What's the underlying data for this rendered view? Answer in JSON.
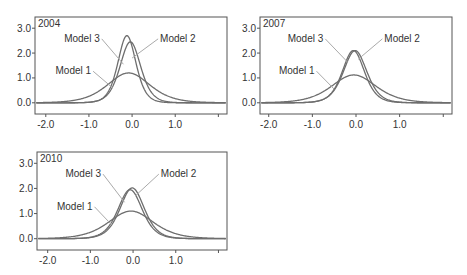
{
  "colors": {
    "curve": "#6e6e6e",
    "frame": "#555555",
    "leader": "#aaaaaa",
    "text": "#333333"
  },
  "chart_data": [
    {
      "type": "line",
      "title": "2004",
      "xlabel": "",
      "ylabel": "",
      "xlim": [
        -2.25,
        2.2
      ],
      "ylim": [
        -0.45,
        3.45
      ],
      "xticks": [
        -2.0,
        -1.0,
        0.0,
        1.0,
        2.0
      ],
      "xtick_labels": [
        "-2.0",
        "-1.0",
        "0.0",
        "1.0",
        ""
      ],
      "yticks": [
        0.0,
        1.0,
        2.0,
        3.0
      ],
      "ytick_labels": [
        "0.0",
        "1.0",
        "2.0",
        "3.0"
      ],
      "grid": false,
      "legend": "direct labels with leader lines",
      "series": [
        {
          "name": "Model 1",
          "peak": 1.2,
          "center": -0.08,
          "width": 0.33,
          "shape": "logistic"
        },
        {
          "name": "Model 2",
          "peak": 2.45,
          "center": -0.04,
          "width": 0.16,
          "shape": "logistic"
        },
        {
          "name": "Model 3",
          "peak": 2.7,
          "center": -0.12,
          "width": 0.14,
          "shape": "logistic"
        }
      ],
      "labels": [
        {
          "text": "Model 3",
          "x": -0.75,
          "y": 2.45,
          "to_x": -0.2,
          "to_y": 1.55
        },
        {
          "text": "Model 2",
          "x": 0.65,
          "y": 2.45,
          "to_x": 0.0,
          "to_y": 1.8
        },
        {
          "text": "Model 1",
          "x": -0.95,
          "y": 1.15,
          "to_x": -0.45,
          "to_y": 0.6
        }
      ]
    },
    {
      "type": "line",
      "title": "2007",
      "xlabel": "",
      "ylabel": "",
      "xlim": [
        -2.2,
        2.2
      ],
      "ylim": [
        -0.45,
        3.45
      ],
      "xticks": [
        -2.0,
        -1.0,
        0.0,
        1.0,
        2.0
      ],
      "xtick_labels": [
        "-2.0",
        "-1.0",
        "0.0",
        "1.0",
        ""
      ],
      "yticks": [
        0.0,
        1.0,
        2.0,
        3.0
      ],
      "ytick_labels": [
        "0.0",
        "1.0",
        "2.0",
        "3.0"
      ],
      "grid": false,
      "legend": "direct labels with leader lines",
      "series": [
        {
          "name": "Model 1",
          "peak": 1.12,
          "center": -0.05,
          "width": 0.34,
          "shape": "logistic"
        },
        {
          "name": "Model 2",
          "peak": 2.1,
          "center": -0.02,
          "width": 0.18,
          "shape": "logistic"
        },
        {
          "name": "Model 3",
          "peak": 2.1,
          "center": -0.06,
          "width": 0.17,
          "shape": "logistic"
        }
      ],
      "labels": [
        {
          "text": "Model 3",
          "x": -0.75,
          "y": 2.45,
          "to_x": -0.2,
          "to_y": 1.65
        },
        {
          "text": "Model 2",
          "x": 0.65,
          "y": 2.45,
          "to_x": 0.05,
          "to_y": 1.75
        },
        {
          "text": "Model 1",
          "x": -0.95,
          "y": 1.15,
          "to_x": -0.5,
          "to_y": 0.55
        }
      ]
    },
    {
      "type": "line",
      "title": "2010",
      "xlabel": "",
      "ylabel": "",
      "xlim": [
        -2.25,
        2.2
      ],
      "ylim": [
        -0.45,
        3.45
      ],
      "xticks": [
        -2.0,
        -1.0,
        0.0,
        1.0,
        2.0
      ],
      "xtick_labels": [
        "-2.0",
        "-1.0",
        "0.0",
        "1.0",
        ""
      ],
      "yticks": [
        0.0,
        1.0,
        2.0,
        3.0
      ],
      "ytick_labels": [
        "0.0",
        "1.0",
        "2.0",
        "3.0"
      ],
      "grid": false,
      "legend": "direct labels with leader lines",
      "series": [
        {
          "name": "Model 1",
          "peak": 1.1,
          "center": -0.05,
          "width": 0.35,
          "shape": "logistic"
        },
        {
          "name": "Model 2",
          "peak": 2.02,
          "center": -0.02,
          "width": 0.19,
          "shape": "logistic"
        },
        {
          "name": "Model 3",
          "peak": 1.95,
          "center": -0.07,
          "width": 0.19,
          "shape": "logistic"
        }
      ],
      "labels": [
        {
          "text": "Model 3",
          "x": -0.75,
          "y": 2.45,
          "to_x": -0.2,
          "to_y": 1.45
        },
        {
          "text": "Model 2",
          "x": 0.65,
          "y": 2.45,
          "to_x": 0.05,
          "to_y": 1.7
        },
        {
          "text": "Model 1",
          "x": -0.95,
          "y": 1.15,
          "to_x": -0.5,
          "to_y": 0.55
        }
      ]
    }
  ],
  "panels_layout": [
    {
      "left": 35,
      "top": 17,
      "right": 227,
      "bottom": 114
    },
    {
      "left": 260,
      "top": 17,
      "right": 452,
      "bottom": 114
    },
    {
      "left": 37,
      "top": 152,
      "right": 227,
      "bottom": 250
    }
  ]
}
